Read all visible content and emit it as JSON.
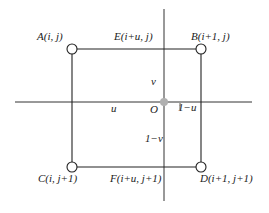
{
  "diagram": {
    "type": "bilinear-interpolation-grid",
    "colors": {
      "line": "#222222",
      "origin": "#b0b0b0",
      "background": "#ffffff"
    },
    "nodes": [
      {
        "id": "A",
        "label": "A(i, j)"
      },
      {
        "id": "B",
        "label": "B(i+1, j)"
      },
      {
        "id": "C",
        "label": "C(i, j+1)"
      },
      {
        "id": "D",
        "label": "D(i+1, j+1)"
      }
    ],
    "edge_points": [
      {
        "id": "E",
        "label": "E(i+u, j)"
      },
      {
        "id": "F",
        "label": "F(i+u, j+1)"
      }
    ],
    "origin": {
      "label": "O"
    },
    "distances": {
      "u": "u",
      "one_minus_u": "1−u",
      "v": "v",
      "one_minus_v": "1−v"
    }
  }
}
